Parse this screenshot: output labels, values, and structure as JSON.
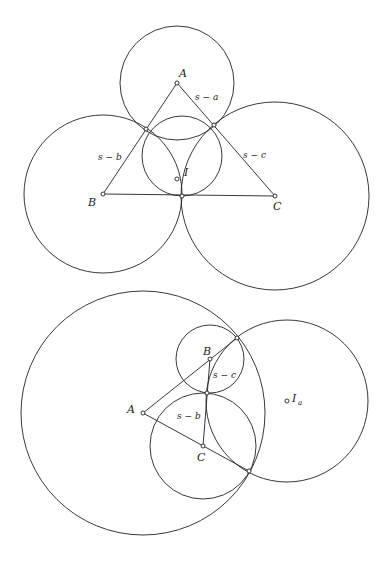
{
  "figure_top": {
    "description": "Triangle ABC with incircle and three mutually tangent circles centered at the vertices",
    "points": {
      "A": {
        "label": "A",
        "x": 177,
        "y": 83
      },
      "B": {
        "label": "B",
        "x": 103,
        "y": 194
      },
      "C": {
        "label": "C",
        "x": 275,
        "y": 196
      },
      "I": {
        "label": "I",
        "x": 182,
        "y": 156
      },
      "T_ab": {
        "x": 146,
        "y": 129
      },
      "T_ac": {
        "x": 214,
        "y": 125
      },
      "T_bc": {
        "x": 182,
        "y": 196
      }
    },
    "circles": [
      {
        "name": "circle-A",
        "cx": 177,
        "cy": 83,
        "r": 57
      },
      {
        "name": "circle-B",
        "cx": 103,
        "cy": 194,
        "r": 79
      },
      {
        "name": "circle-C",
        "cx": 275,
        "cy": 196,
        "r": 94
      },
      {
        "name": "incircle",
        "cx": 182,
        "cy": 156,
        "r": 40
      }
    ],
    "segment_labels": {
      "s_minus_a": "s − a",
      "s_minus_b": "s − b",
      "s_minus_c": "s − c"
    }
  },
  "figure_bottom": {
    "description": "Triangle ABC with A-excircle and circles centered at the vertices tangent to it",
    "points": {
      "A": {
        "label": "A",
        "x": 143,
        "y": 413
      },
      "B": {
        "label": "B",
        "x": 210,
        "y": 359
      },
      "C": {
        "label": "C",
        "x": 203,
        "y": 446
      },
      "Ia": {
        "label": "I",
        "sub": "a",
        "x": 287,
        "y": 401
      },
      "T1": {
        "x": 237,
        "y": 338
      },
      "T2": {
        "x": 207,
        "y": 393
      },
      "T3": {
        "x": 249,
        "y": 471
      }
    },
    "circles": [
      {
        "name": "circle-A",
        "cx": 143,
        "cy": 413,
        "r": 122
      },
      {
        "name": "circle-B",
        "cx": 210,
        "cy": 359,
        "r": 34
      },
      {
        "name": "circle-C",
        "cx": 203,
        "cy": 446,
        "r": 53
      },
      {
        "name": "excircle",
        "cx": 287,
        "cy": 401,
        "r": 81
      }
    ],
    "segment_labels": {
      "s_minus_b": "s − b",
      "s_minus_c": "s − c"
    }
  }
}
